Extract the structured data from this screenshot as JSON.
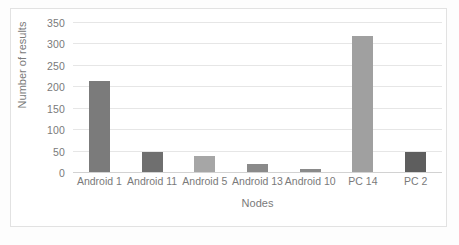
{
  "chart_data": {
    "type": "bar",
    "title": "",
    "subtitle": "",
    "xlabel": "Nodes",
    "ylabel": "Number of results",
    "categories": [
      "Android 1",
      "Android 11",
      "Android 5",
      "Android 13",
      "Android 10",
      "PC 14",
      "PC 2"
    ],
    "values": [
      215,
      50,
      40,
      22,
      10,
      320,
      50
    ],
    "bar_colors": [
      "#7b7b7b",
      "#6f6f6f",
      "#a6a6a6",
      "#8a8a8a",
      "#8a8a8a",
      "#a0a0a0",
      "#5e5e5e"
    ],
    "ylim": [
      0,
      350
    ],
    "ytick_values": [
      0,
      50,
      100,
      150,
      200,
      250,
      300,
      350
    ],
    "ytick_labels": [
      "0",
      "50",
      "100",
      "150",
      "200",
      "250",
      "300",
      "350"
    ],
    "grid": true,
    "grid_color": "#e6e6e6",
    "legend": null,
    "legend_position": "none",
    "axis_text_color": "#7a7a7a",
    "plot_background": "#ffffff",
    "frame_color": "#e2e2e2"
  }
}
